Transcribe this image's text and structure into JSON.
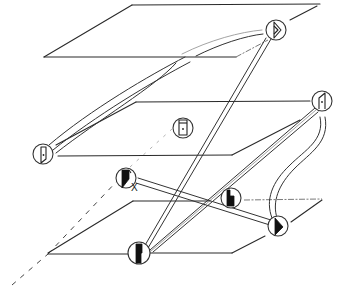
{
  "diagram": {
    "planes": [
      {
        "id": "top-plane",
        "level": 1
      },
      {
        "id": "middle-plane",
        "level": 2
      },
      {
        "id": "bottom-plane",
        "level": 3
      }
    ],
    "nodes": [
      {
        "id": "top-right-node",
        "plane": "top-plane",
        "glyph": "open-half-triangle"
      },
      {
        "id": "middle-left-node",
        "plane": "middle-plane",
        "glyph": "open-door-dot"
      },
      {
        "id": "middle-center-node",
        "plane": "middle-plane",
        "glyph": "closed-door-dot"
      },
      {
        "id": "middle-right-node",
        "plane": "middle-plane",
        "glyph": "open-door-dot"
      },
      {
        "id": "floating-x-node",
        "plane": "between",
        "glyph": "filled-door",
        "mark": "X"
      },
      {
        "id": "bottom-center-node",
        "plane": "bottom-plane",
        "glyph": "filled-step"
      },
      {
        "id": "bottom-inner-node",
        "plane": "bottom-plane",
        "glyph": "filled-notch"
      },
      {
        "id": "bottom-right-node",
        "plane": "bottom-plane",
        "glyph": "filled-triangle"
      }
    ],
    "x_mark": "X"
  }
}
